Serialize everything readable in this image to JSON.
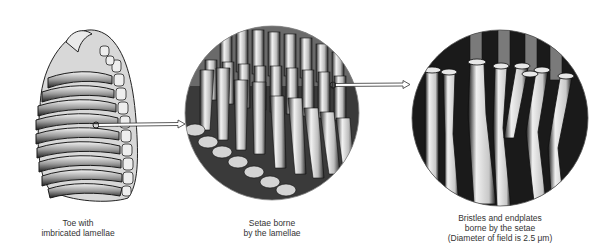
{
  "figure": {
    "panels": [
      {
        "id": "toe",
        "label_lines": [
          "Toe with",
          "imbricated lamellae"
        ]
      },
      {
        "id": "setae",
        "label_lines": [
          "Setae borne",
          "by the lamellae"
        ]
      },
      {
        "id": "bristles",
        "label_lines": [
          "Bristles and endplates",
          "borne by the setae",
          "(Diameter of field is 2.5 μm)"
        ]
      }
    ],
    "colors": {
      "ink": "#1a1a1a",
      "shade": "#555555",
      "highlight": "#f4f4f4",
      "background": "#ffffff"
    }
  }
}
